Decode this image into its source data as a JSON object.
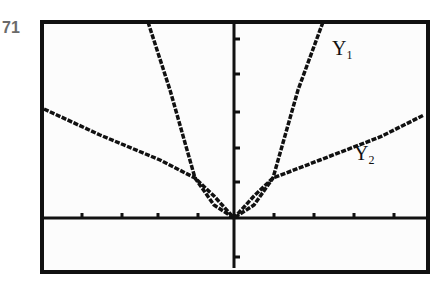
{
  "exercise_number": "71",
  "chart_data": {
    "type": "line",
    "title": "",
    "xlabel": "",
    "ylabel": "",
    "grid": false,
    "legend": "inline labels",
    "axes": {
      "origin_px": [
        234,
        218
      ],
      "x_ticks_px": [
        82,
        122,
        158,
        198,
        274,
        314,
        354,
        394
      ],
      "y_ticks_px": [
        39,
        74,
        112,
        148,
        182,
        257
      ]
    },
    "series": [
      {
        "name": "Y1",
        "label_main": "Y",
        "label_sub": "1",
        "points_px": [
          [
            148,
            22
          ],
          [
            170,
            90
          ],
          [
            195,
            178
          ],
          [
            214,
            205
          ],
          [
            234,
            218
          ],
          [
            254,
            205
          ],
          [
            273,
            178
          ],
          [
            298,
            90
          ],
          [
            323,
            22
          ]
        ]
      },
      {
        "name": "Y2",
        "label_main": "Y",
        "label_sub": "2",
        "points_px": [
          [
            44,
            109
          ],
          [
            100,
            135
          ],
          [
            160,
            160
          ],
          [
            195,
            178
          ],
          [
            214,
            196
          ],
          [
            234,
            218
          ],
          [
            254,
            196
          ],
          [
            273,
            178
          ],
          [
            320,
            160
          ],
          [
            380,
            137
          ],
          [
            424,
            115
          ]
        ]
      }
    ]
  },
  "frame": {
    "x": 42,
    "y": 22,
    "width": 386,
    "height": 250
  }
}
